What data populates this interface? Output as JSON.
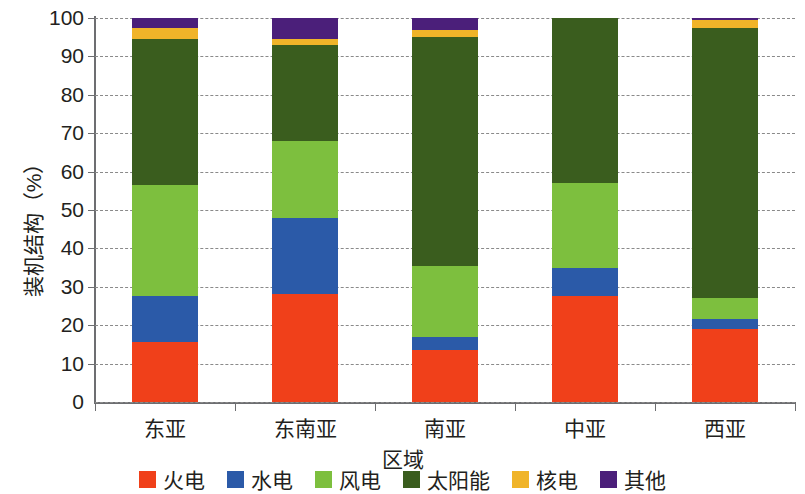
{
  "chart_data": {
    "type": "bar",
    "subtype": "stacked-100-percent",
    "title": "",
    "xlabel": "区域",
    "ylabel": "装机结构（%）",
    "categories": [
      "东亚",
      "东南亚",
      "南亚",
      "中亚",
      "西亚"
    ],
    "ylim": [
      0,
      100
    ],
    "ytick_labels": [
      "0",
      "10",
      "20",
      "30",
      "40",
      "50",
      "60",
      "70",
      "80",
      "90",
      "100"
    ],
    "ytick_values": [
      0,
      10,
      20,
      30,
      40,
      50,
      60,
      70,
      80,
      90,
      100
    ],
    "grid": true,
    "grid_style": "dashed-horizontal",
    "legend_position": "bottom",
    "series": [
      {
        "name": "火电",
        "color": "#f0401a",
        "values": [
          15.5,
          28.0,
          13.5,
          27.5,
          19.0
        ]
      },
      {
        "name": "水电",
        "color": "#2b5aa8",
        "values": [
          12.0,
          20.0,
          3.5,
          7.5,
          2.5
        ]
      },
      {
        "name": "风电",
        "color": "#7dbf3e",
        "values": [
          29.0,
          20.0,
          18.5,
          22.0,
          5.5
        ]
      },
      {
        "name": "太阳能",
        "color": "#3a5d1e",
        "values": [
          38.0,
          25.0,
          59.5,
          43.0,
          70.5
        ]
      },
      {
        "name": "核电",
        "color": "#f0b429",
        "values": [
          3.0,
          1.5,
          2.0,
          0.0,
          2.0
        ]
      },
      {
        "name": "其他",
        "color": "#4b1f7a",
        "values": [
          2.5,
          5.5,
          3.0,
          0.0,
          0.5
        ]
      }
    ]
  },
  "axis": {
    "y_title": "装机结构（%）",
    "x_title": "区域"
  }
}
